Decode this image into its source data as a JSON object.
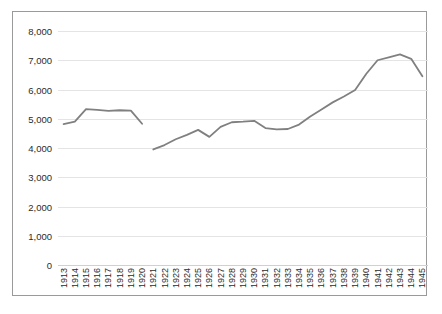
{
  "chart_data": {
    "type": "line",
    "title": "",
    "xlabel": "",
    "ylabel": "",
    "ylim": [
      0,
      8000
    ],
    "ytick_labels": [
      "8,000",
      "7,000",
      "6,000",
      "5,000",
      "4,000",
      "3,000",
      "2,000",
      "1,000",
      "0"
    ],
    "ytick_values": [
      8000,
      7000,
      6000,
      5000,
      4000,
      3000,
      2000,
      1000,
      0
    ],
    "grid": true,
    "legend": "none",
    "line_color": "#808080",
    "categories": [
      "1913",
      "1914",
      "1915",
      "1916",
      "1917",
      "1918",
      "1919",
      "1920",
      "1921",
      "1922",
      "1923",
      "1924",
      "1925",
      "1926",
      "1927",
      "1928",
      "1929",
      "1930",
      "1931",
      "1932",
      "1933",
      "1934",
      "1935",
      "1936",
      "1937",
      "1938",
      "1939",
      "1940",
      "1941",
      "1942",
      "1943",
      "1944",
      "1945"
    ],
    "series": [
      {
        "name": "segment-1",
        "x": [
          "1913",
          "1914",
          "1915",
          "1916",
          "1917",
          "1918",
          "1919",
          "1920"
        ],
        "values": [
          4820,
          4900,
          5330,
          5300,
          5270,
          5290,
          5280,
          4830
        ]
      },
      {
        "name": "segment-2",
        "x": [
          "1921",
          "1922",
          "1923",
          "1924",
          "1925",
          "1926",
          "1927",
          "1928",
          "1929",
          "1930",
          "1931",
          "1932",
          "1933",
          "1934",
          "1935",
          "1936",
          "1937",
          "1938",
          "1939",
          "1940",
          "1941",
          "1942",
          "1943",
          "1944",
          "1945"
        ],
        "values": [
          3950,
          4100,
          4300,
          4450,
          4620,
          4380,
          4720,
          4880,
          4900,
          4930,
          4680,
          4640,
          4650,
          4800,
          5080,
          5320,
          5560,
          5760,
          5980,
          6540,
          7000,
          7100,
          7200,
          7050,
          6450
        ]
      }
    ],
    "gap_between": [
      "1920",
      "1921"
    ]
  }
}
